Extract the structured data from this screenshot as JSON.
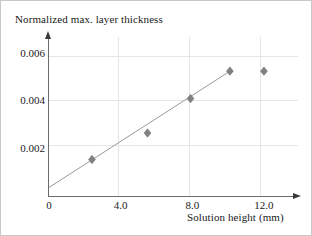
{
  "chart_data": {
    "type": "scatter",
    "title": "",
    "ylabel": "Normalized max. layer thickness",
    "xlabel": "Solution height (mm)",
    "xlim": [
      0,
      13.9
    ],
    "ylim": [
      0,
      0.0067
    ],
    "grid": true,
    "legend": null,
    "xticks": [
      {
        "value": 0,
        "label": "0"
      },
      {
        "value": 4,
        "label": "4.0"
      },
      {
        "value": 8,
        "label": "8.0"
      },
      {
        "value": 12,
        "label": "12.0"
      }
    ],
    "yticks": [
      {
        "value": 0.002,
        "label": "0.002"
      },
      {
        "value": 0.004,
        "label": "0.004"
      },
      {
        "value": 0.006,
        "label": "0.006"
      }
    ],
    "series": [
      {
        "name": "measurements",
        "type": "scatter",
        "marker": "diamond",
        "color": "#808080",
        "points": [
          {
            "x": 2.4,
            "y": 0.00157
          },
          {
            "x": 5.5,
            "y": 0.00268
          },
          {
            "x": 7.9,
            "y": 0.00412
          },
          {
            "x": 10.1,
            "y": 0.00527
          },
          {
            "x": 12.0,
            "y": 0.00527
          }
        ]
      },
      {
        "name": "linear-fit",
        "type": "line",
        "color": "#999999",
        "points": [
          {
            "x": 0.0,
            "y": 0.0004
          },
          {
            "x": 10.1,
            "y": 0.00527
          }
        ]
      }
    ],
    "colors": {
      "marker": "#808080",
      "trendline": "#999999",
      "gridline": "#e6e6e6",
      "axis": "#6b6b6b",
      "text": "#1a1a1a",
      "background": "#ffffff",
      "border": "#c8c8c8"
    }
  }
}
